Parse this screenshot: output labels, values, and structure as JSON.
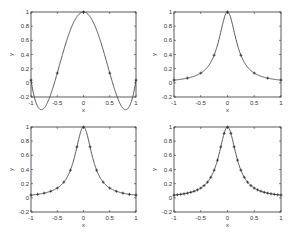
{
  "chart_data": [
    {
      "type": "line",
      "title": "",
      "xlabel": "x",
      "ylabel": "y",
      "xlim": [
        -1,
        1
      ],
      "ylim": [
        -0.2,
        1
      ],
      "xticks": [
        "-1",
        "-0.5",
        "0",
        "0.5",
        "1"
      ],
      "yticks": [
        "-0.2",
        "0",
        "0.2",
        "0.4",
        "0.6",
        "0.8",
        "1"
      ],
      "grid": false,
      "nodes": 5,
      "series": [
        {
          "name": "interpolant",
          "style": "line"
        },
        {
          "name": "nodes",
          "style": "markers",
          "x": [
            -1,
            -0.5,
            0,
            0.5,
            1
          ],
          "y": [
            0.038,
            0.138,
            1.0,
            0.138,
            0.038
          ]
        }
      ],
      "curve_samples": {
        "x": [
          -1,
          -0.75,
          -0.5,
          -0.25,
          0,
          0.25,
          0.5,
          0.75,
          1
        ],
        "y": [
          0.038,
          -0.05,
          0.138,
          0.68,
          1.0,
          0.68,
          0.138,
          -0.05,
          0.038
        ]
      }
    },
    {
      "type": "line",
      "title": "",
      "xlabel": "x",
      "ylabel": "y",
      "xlim": [
        -1,
        1
      ],
      "ylim": [
        -0.2,
        1
      ],
      "xticks": [
        "-1",
        "-0.5",
        "0",
        "0.5",
        "1"
      ],
      "yticks": [
        "-0.2",
        "0",
        "0.2",
        "0.4",
        "0.6",
        "0.8",
        "1"
      ],
      "grid": false,
      "nodes": 9,
      "series": [
        {
          "name": "interpolant",
          "style": "line"
        },
        {
          "name": "nodes",
          "style": "markers",
          "x": [
            -1,
            -0.75,
            -0.5,
            -0.25,
            0,
            0.25,
            0.5,
            0.75,
            1
          ],
          "y": [
            0.038,
            0.066,
            0.138,
            0.39,
            1.0,
            0.39,
            0.138,
            0.066,
            0.038
          ]
        }
      ]
    },
    {
      "type": "line",
      "title": "",
      "xlabel": "x",
      "ylabel": "y",
      "xlim": [
        -1,
        1
      ],
      "ylim": [
        -0.2,
        1
      ],
      "xticks": [
        "-1",
        "-0.5",
        "0",
        "0.5",
        "1"
      ],
      "yticks": [
        "-0.2",
        "0",
        "0.2",
        "0.4",
        "0.6",
        "0.8",
        "1"
      ],
      "grid": false,
      "nodes": 17,
      "series": [
        {
          "name": "interpolant",
          "style": "line"
        },
        {
          "name": "nodes",
          "style": "markers",
          "x": [
            -1,
            -0.875,
            -0.75,
            -0.625,
            -0.5,
            -0.375,
            -0.25,
            -0.125,
            0,
            0.125,
            0.25,
            0.375,
            0.5,
            0.625,
            0.75,
            0.875,
            1
          ],
          "y": [
            0.038,
            0.05,
            0.066,
            0.093,
            0.138,
            0.221,
            0.39,
            0.719,
            1.0,
            0.719,
            0.39,
            0.221,
            0.138,
            0.093,
            0.066,
            0.05,
            0.038
          ]
        }
      ]
    },
    {
      "type": "line",
      "title": "",
      "xlabel": "x",
      "ylabel": "y",
      "xlim": [
        -1,
        1
      ],
      "ylim": [
        -0.2,
        1
      ],
      "xticks": [
        "-1",
        "-0.5",
        "0",
        "0.5",
        "1"
      ],
      "yticks": [
        "-0.2",
        "0",
        "0.2",
        "0.4",
        "0.6",
        "0.8",
        "1"
      ],
      "grid": false,
      "nodes": 33,
      "series": [
        {
          "name": "interpolant",
          "style": "line"
        },
        {
          "name": "nodes",
          "style": "markers",
          "count": 33,
          "function": "1/(1+25x^2)"
        }
      ]
    }
  ],
  "layout": {
    "panels": [
      {
        "left": 31,
        "top": 12,
        "width": 105,
        "height": 85
      },
      {
        "left": 174,
        "top": 12,
        "width": 107,
        "height": 85
      },
      {
        "left": 31,
        "top": 127,
        "width": 105,
        "height": 85
      },
      {
        "left": 174,
        "top": 127,
        "width": 107,
        "height": 85
      }
    ],
    "line_color": "#444444",
    "axis_color": "#333333"
  }
}
